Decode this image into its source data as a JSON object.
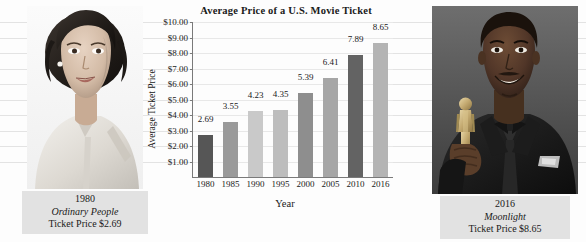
{
  "chart_data": {
    "type": "bar",
    "title": "Average Price of a U.S. Movie Ticket",
    "xlabel": "Year",
    "ylabel": "Average Ticket Price",
    "categories": [
      "1980",
      "1985",
      "1990",
      "1995",
      "2000",
      "2005",
      "2010",
      "2016"
    ],
    "values": [
      2.69,
      3.55,
      4.23,
      4.35,
      5.39,
      6.41,
      7.89,
      8.65
    ],
    "value_labels": [
      "2.69",
      "3.55",
      "4.23",
      "4.35",
      "5.39",
      "6.41",
      "7.89",
      "8.65"
    ],
    "bar_colors": [
      "#565656",
      "#9a9a9a",
      "#c9c9c9",
      "#bdbdbd",
      "#8e8e8e",
      "#a6a6a6",
      "#636363",
      "#b4b4b4"
    ],
    "ylim": [
      0,
      10
    ],
    "ytick_labels": [
      "$1.00",
      "$2.00",
      "$3.00",
      "$4.00",
      "$5.00",
      "$6.00",
      "$7.00",
      "$8.00",
      "$9.00",
      "$10.00"
    ],
    "ytick_values": [
      1,
      2,
      3,
      4,
      5,
      6,
      7,
      8,
      9,
      10
    ],
    "grid": true,
    "legend": "none"
  },
  "left_photo": {
    "alt": "portrait-of-actress-in-light-blouse",
    "caption_year": "1980",
    "caption_movie": "Ordinary People",
    "caption_price": "Ticket Price $2.69"
  },
  "right_photo": {
    "alt": "actor-in-tuxedo-holding-oscar-statuette",
    "caption_year": "2016",
    "caption_movie": "Moonlight",
    "caption_price": "Ticket Price $8.65"
  }
}
